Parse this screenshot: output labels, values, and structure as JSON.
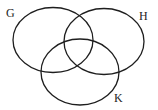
{
  "diagram": {
    "type": "venn",
    "sets": [
      {
        "id": "G",
        "label": "G",
        "cx": 53,
        "cy": 40,
        "rx": 40,
        "ry": 32.5,
        "label_x": 6,
        "label_y": 17
      },
      {
        "id": "H",
        "label": "H",
        "cx": 104,
        "cy": 41.5,
        "rx": 40,
        "ry": 33,
        "label_x": 139,
        "label_y": 20
      },
      {
        "id": "K",
        "label": "K",
        "cx": 80,
        "cy": 72,
        "rx": 39,
        "ry": 33,
        "label_x": 114,
        "label_y": 102
      }
    ],
    "stroke_color": "#1e1e1e",
    "background": "#ffffff"
  }
}
